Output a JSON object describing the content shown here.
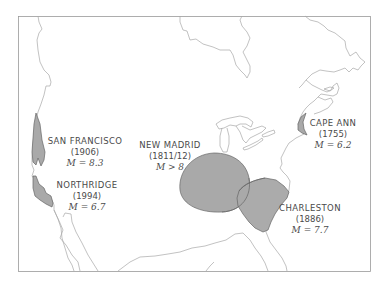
{
  "map": {
    "title": "",
    "region": "United States",
    "colors": {
      "frame": "#9a9a9a",
      "coastline": "#a8a8a8",
      "zone_fill": "#a9a9a9",
      "zone_stroke": "#666666",
      "text": "#4a4a4a"
    },
    "earthquakes": [
      {
        "name": "SAN FRANCISCO",
        "year": "(1906)",
        "magnitude": "M = 8.3"
      },
      {
        "name": "NORTHRIDGE",
        "year": "(1994)",
        "magnitude": "M = 6.7"
      },
      {
        "name": "NEW MADRID",
        "year": "(1811/12)",
        "magnitude": "M > 8"
      },
      {
        "name": "CHARLESTON",
        "year": "(1886)",
        "magnitude": "M = 7.7"
      },
      {
        "name": "CAPE ANN",
        "year": "(1755)",
        "magnitude": "M = 6.2"
      }
    ]
  }
}
